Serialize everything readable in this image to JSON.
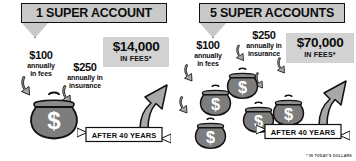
{
  "panels": [
    {
      "id": "one-super-account",
      "banner_label": "1 SUPER ACCOUNT",
      "fee_amount": "$14,000",
      "fee_caption": "IN FEES*",
      "notes": [
        {
          "amount": "$100",
          "desc_line1": "annually",
          "desc_line2": "in fees"
        },
        {
          "amount": "$250",
          "desc_line1": "annually in",
          "desc_line2": "insurance"
        }
      ],
      "purse_count": 1,
      "purse_symbol": "$",
      "ribbon_label": "AFTER 40 YEARS"
    },
    {
      "id": "five-super-accounts",
      "banner_label": "5 SUPER ACCOUNTS",
      "fee_amount": "$70,000",
      "fee_caption": "IN FEES*",
      "notes": [
        {
          "amount": "$100",
          "desc_line1": "annually",
          "desc_line2": "in fees"
        },
        {
          "amount": "$250",
          "desc_line1": "annually in",
          "desc_line2": "insurance"
        }
      ],
      "purse_count": 5,
      "purse_symbol": "$",
      "ribbon_label": "AFTER 40 YEARS"
    }
  ],
  "footnote": "* IN TODAY'S DOLLARS",
  "colors": {
    "banner_fill": "#c9c9c9",
    "fee_box_fill": "#d2d2d2",
    "purse_fill": "#808080",
    "arrow_fill": "#a8a8a8",
    "outline": "#111111",
    "ribbon_fill": "#ffffff"
  }
}
